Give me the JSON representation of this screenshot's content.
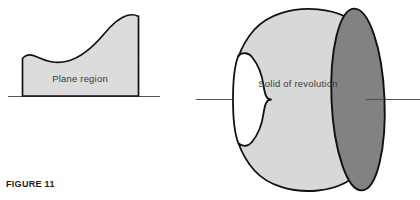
{
  "figure": {
    "caption": "FIGURE 11",
    "background_color": "#ffffff",
    "outline_color": "#111111",
    "label_color": "#3a3a3a"
  },
  "plane_region": {
    "label": "Plane region",
    "fill_color": "#dcdcdc",
    "baseline_color": "#555555"
  },
  "solid_of_revolution": {
    "label": "Solid of revolution",
    "body_fill_color": "#d8d8d8",
    "face_fill_color": "#828282",
    "axis_color": "#555555"
  }
}
